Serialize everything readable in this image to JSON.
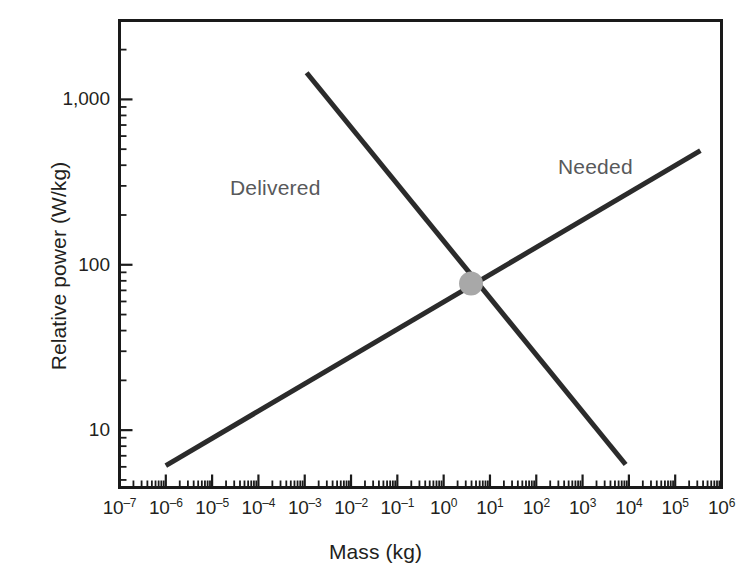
{
  "chart_data": {
    "type": "line",
    "title": "",
    "subtitle": "",
    "xlabel": "Mass (kg)",
    "ylabel": "Relative power (W/kg)",
    "xscale": "log",
    "yscale": "log",
    "xlim": [
      1e-07,
      1000000.0
    ],
    "ylim": [
      4.5,
      3000
    ],
    "grid": false,
    "legend_position": "inline-annotations",
    "x_tick_labels": [
      "10–7",
      "10–6",
      "10–5",
      "10–4",
      "10–3",
      "10–2",
      "10–1",
      "10⁰",
      "10¹",
      "10²",
      "10³",
      "10⁴",
      "10⁵",
      "10⁶"
    ],
    "x_tick_mantissa": "10",
    "x_tick_exponents": [
      "–7",
      "–6",
      "–5",
      "–4",
      "–3",
      "–2",
      "–1",
      "0",
      "1",
      "2",
      "3",
      "4",
      "5",
      "6"
    ],
    "x_tick_values": [
      1e-07,
      1e-06,
      1e-05,
      0.0001,
      0.001,
      0.01,
      0.1,
      1,
      10,
      100,
      1000,
      10000,
      100000,
      1000000
    ],
    "y_tick_labels": [
      "10",
      "100",
      "1,000"
    ],
    "y_tick_values": [
      10,
      100,
      1000
    ],
    "series": [
      {
        "name": "Delivered",
        "label": "Delivered",
        "color": "#2b2b2b",
        "line_width": 5,
        "points": [
          {
            "x": 0.0011,
            "y": 1450
          },
          {
            "x": 8500.0,
            "y": 6.2
          }
        ]
      },
      {
        "name": "Needed",
        "label": "Needed",
        "color": "#2b2b2b",
        "line_width": 5,
        "points": [
          {
            "x": 1e-06,
            "y": 6.1
          },
          {
            "x": 350000.0,
            "y": 490
          }
        ]
      }
    ],
    "annotations": [
      {
        "name": "intersection-marker",
        "type": "point-marker",
        "x": 3.9,
        "y": 77,
        "color": "#a8a8a8",
        "radius_px": 12
      }
    ],
    "colors": {
      "line": "#2b2b2b",
      "frame": "#1a1a1a",
      "marker": "#a8a8a8",
      "annotation_text": "#58595b",
      "axis_text": "#231f20",
      "background": "#ffffff"
    }
  }
}
